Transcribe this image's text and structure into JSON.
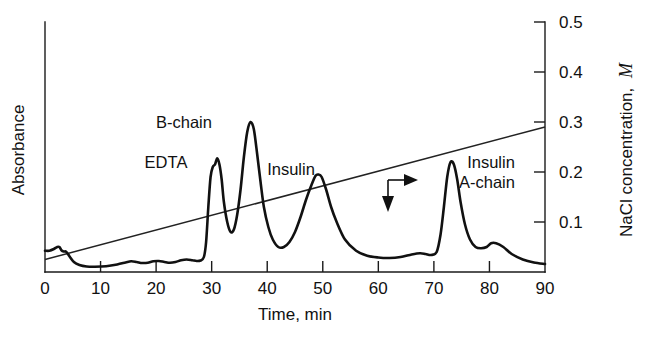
{
  "chart_data": {
    "type": "line",
    "title": "",
    "subtitle": "",
    "xlabel": "Time, min",
    "ylabel": "Absorbance",
    "y2label": "NaCl concentration, M",
    "y2label_plain": "NaCl concentration,",
    "y2label_italic": "M",
    "xlim": [
      0,
      90
    ],
    "ylim": [
      0,
      1
    ],
    "y2lim": [
      0,
      0.5
    ],
    "grid": false,
    "legend": "none",
    "xticks": [
      0,
      10,
      20,
      30,
      40,
      50,
      60,
      70,
      80,
      90
    ],
    "xticklabels": [
      "0",
      "10",
      "20",
      "30",
      "40",
      "50",
      "60",
      "70",
      "80",
      "90"
    ],
    "yticks": [],
    "yticklabels": [],
    "y2ticks": [
      0.1,
      0.2,
      0.3,
      0.4,
      0.5
    ],
    "y2ticklabels": [
      "0.1",
      "0.2",
      "0.3",
      "0.4",
      "0.5"
    ],
    "series": [
      {
        "name": "Absorbance trace",
        "axis": "left",
        "x": [
          0.0,
          0.8,
          1.6,
          2.2,
          2.6,
          3.0,
          3.4,
          3.8,
          4.4,
          5.2,
          6.2,
          7.5,
          9.0,
          11.0,
          13.0,
          14.5,
          15.5,
          16.5,
          17.5,
          18.5,
          19.5,
          20.5,
          21.5,
          22.5,
          23.5,
          24.5,
          25.5,
          26.5,
          27.3,
          28.0,
          28.6,
          29.0,
          29.4,
          29.8,
          30.2,
          30.6,
          31.0,
          31.4,
          31.8,
          32.2,
          32.8,
          33.4,
          34.0,
          34.6,
          35.2,
          35.8,
          36.4,
          37.0,
          37.6,
          38.2,
          38.8,
          39.4,
          40.2,
          41.0,
          42.0,
          43.0,
          44.0,
          45.0,
          46.0,
          47.0,
          48.0,
          48.7,
          49.2,
          49.8,
          50.6,
          51.5,
          52.5,
          54.0,
          56.0,
          58.0,
          60.0,
          62.0,
          64.0,
          66.0,
          67.5,
          68.5,
          69.5,
          70.5,
          71.2,
          71.8,
          72.4,
          73.0,
          73.6,
          74.2,
          74.8,
          75.6,
          76.5,
          77.5,
          78.5,
          79.5,
          80.3,
          81.2,
          82.5,
          84.0,
          86.0,
          88.0,
          90.0
        ],
        "y": [
          0.085,
          0.085,
          0.092,
          0.1,
          0.1,
          0.086,
          0.082,
          0.081,
          0.063,
          0.04,
          0.028,
          0.022,
          0.021,
          0.023,
          0.03,
          0.038,
          0.043,
          0.04,
          0.036,
          0.037,
          0.043,
          0.044,
          0.04,
          0.037,
          0.04,
          0.047,
          0.05,
          0.047,
          0.044,
          0.046,
          0.06,
          0.12,
          0.26,
          0.38,
          0.42,
          0.43,
          0.455,
          0.43,
          0.37,
          0.28,
          0.2,
          0.16,
          0.17,
          0.23,
          0.33,
          0.46,
          0.56,
          0.6,
          0.57,
          0.47,
          0.36,
          0.26,
          0.18,
          0.13,
          0.1,
          0.1,
          0.12,
          0.16,
          0.22,
          0.29,
          0.35,
          0.385,
          0.39,
          0.38,
          0.33,
          0.26,
          0.2,
          0.13,
          0.085,
          0.065,
          0.058,
          0.056,
          0.06,
          0.07,
          0.075,
          0.072,
          0.068,
          0.08,
          0.15,
          0.26,
          0.38,
          0.44,
          0.43,
          0.37,
          0.28,
          0.19,
          0.13,
          0.1,
          0.095,
          0.1,
          0.115,
          0.115,
          0.1,
          0.072,
          0.05,
          0.038,
          0.032
        ]
      },
      {
        "name": "NaCl gradient",
        "axis": "right",
        "x": [
          0,
          90
        ],
        "y": [
          0.025,
          0.29
        ]
      }
    ],
    "annotations": [
      {
        "id": "edta-label",
        "text": "EDTA",
        "x_px": 166,
        "y_px": 168
      },
      {
        "id": "b-chain-label",
        "text": "B-chain",
        "x_px": 184,
        "y_px": 128
      },
      {
        "id": "insulin-label",
        "text": "Insulin",
        "x_px": 291,
        "y_px": 175
      },
      {
        "id": "insulin-a-chain-label-line1",
        "text": "Insulin",
        "x_px": 491,
        "y_px": 168
      },
      {
        "id": "insulin-a-chain-label-line2",
        "text": "A-chain",
        "x_px": 487,
        "y_px": 188
      },
      {
        "id": "gradient-pointer",
        "text": "",
        "x_px": 388,
        "y_px": 182
      }
    ]
  },
  "figure": {
    "left_axis_title": "Absorbance",
    "bottom_axis_title": "Time, min",
    "right_axis_title_plain": "NaCl concentration,",
    "right_axis_title_italic": "M"
  }
}
